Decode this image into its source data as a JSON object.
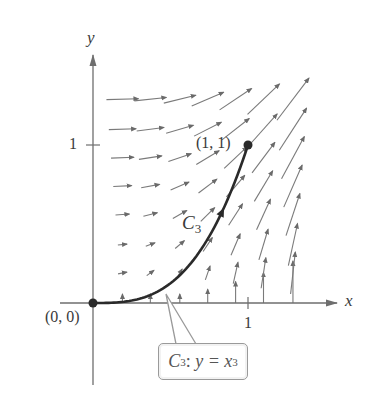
{
  "axes": {
    "x_label": "x",
    "y_label": "y",
    "x_tick_label": "1",
    "y_tick_label": "1",
    "origin_px": [
      93,
      303
    ],
    "unit_px": [
      155,
      158
    ],
    "x_axis_end_px": 337,
    "y_axis_top_px": 55,
    "axis_color": "#6e6e6e"
  },
  "points": {
    "origin": {
      "label": "(0, 0)",
      "x": 0,
      "y": 0
    },
    "end": {
      "label": "(1, 1)",
      "x": 1,
      "y": 1
    }
  },
  "curve": {
    "name": "C",
    "subscript": "3",
    "equation": "y = x",
    "exponent": "3",
    "callout_name": "C",
    "callout_sub": "3",
    "callout_sep": ":",
    "color": "#2a2a2a"
  },
  "vector_field": {
    "formula": "F(x, y) = y i + x² j",
    "grid_x": [
      0.19,
      0.37,
      0.56,
      0.74,
      0.92,
      1.1,
      1.29
    ],
    "grid_y": [
      0.0,
      0.19,
      0.37,
      0.56,
      0.74,
      0.92,
      1.1,
      1.29
    ],
    "arrow_scale": 0.16,
    "arrow_color": "#7a7a7a"
  }
}
